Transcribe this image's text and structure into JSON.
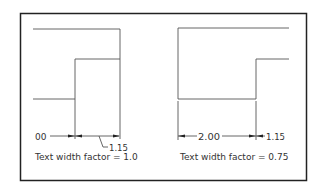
{
  "figure": {
    "left_panel": {
      "dim_left_text": "00",
      "dim_right_text": "1.15",
      "caption": "Text width factor = 1.0"
    },
    "right_panel": {
      "dim_left_text": "2.00",
      "dim_right_text": "1.15",
      "caption": "Text width factor = 0.75"
    },
    "colors": {
      "frame": "#222222",
      "lines": "#555555",
      "text": "#333333"
    }
  }
}
